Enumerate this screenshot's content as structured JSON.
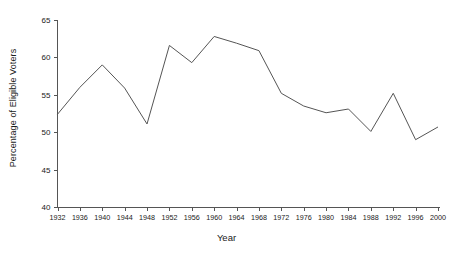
{
  "chart_data": {
    "type": "line",
    "title": "",
    "xlabel": "Year",
    "ylabel": "Percentage of Eligible Voters",
    "grid": false,
    "legend": "none",
    "xlim": [
      1932,
      2000
    ],
    "ylim": [
      40,
      65
    ],
    "ytick_labels": [
      "65",
      "60",
      "55",
      "50",
      "45",
      "40"
    ],
    "ytick_values": [
      65,
      60,
      55,
      50,
      45,
      40
    ],
    "categories": [
      1932,
      1936,
      1940,
      1944,
      1948,
      1952,
      1956,
      1960,
      1964,
      1968,
      1972,
      1976,
      1980,
      1984,
      1988,
      1992,
      1996,
      2000
    ],
    "xtick_labels": [
      "1932",
      "1936",
      "1940",
      "1944",
      "1948",
      "1952",
      "1956",
      "1960",
      "1964",
      "1968",
      "1972",
      "1976",
      "1980",
      "1984",
      "1988",
      "1992",
      "1996",
      "2000"
    ],
    "series": [
      {
        "name": "Voter turnout",
        "values": [
          52.4,
          56.0,
          59.0,
          55.9,
          51.1,
          61.6,
          59.3,
          62.8,
          61.9,
          60.9,
          55.2,
          53.5,
          52.6,
          53.1,
          50.1,
          55.2,
          49.0,
          50.7
        ]
      }
    ]
  }
}
